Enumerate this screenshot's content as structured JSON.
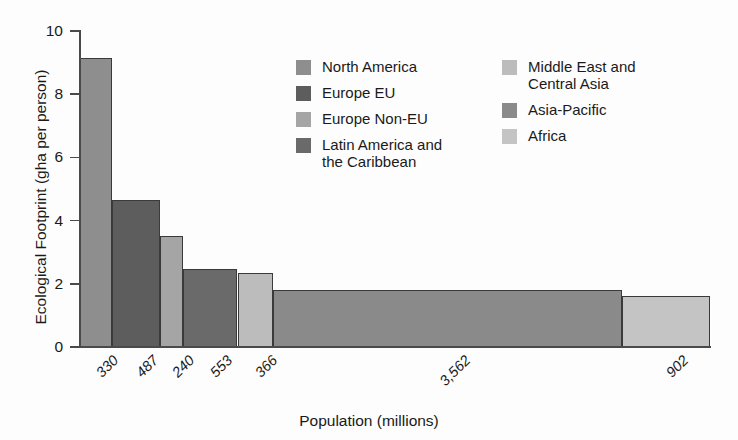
{
  "chart_data": {
    "type": "bar",
    "variant": "variable-width-bar",
    "title": "",
    "xlabel": "Population (millions)",
    "ylabel": "Ecological Footprint (gha per person)",
    "ylim": [
      0,
      10
    ],
    "yticks": [
      0,
      2,
      4,
      6,
      8,
      10
    ],
    "ytick_labels": [
      "0",
      "2",
      "4",
      "6",
      "8",
      "10"
    ],
    "grid": false,
    "legend_position": "inside-upper-center",
    "x_is_cumulative_population": true,
    "categories": [
      "North America",
      "Europe EU",
      "Europe Non-EU",
      "Latin America and the Caribbean",
      "Middle East and Central Asia",
      "Asia-Pacific",
      "Africa"
    ],
    "xtick_labels": [
      "330",
      "487",
      "240",
      "553",
      "366",
      "3,562",
      "902"
    ],
    "series": [
      {
        "name": "Ecological Footprint (gha per person)",
        "values": [
          9.15,
          4.65,
          3.5,
          2.48,
          2.35,
          1.8,
          1.6
        ]
      },
      {
        "name": "Population (millions)",
        "values": [
          330,
          487,
          240,
          553,
          366,
          3562,
          902
        ]
      }
    ],
    "bars": [
      {
        "label": "North America",
        "population": 330,
        "population_label": "330",
        "footprint": 9.15,
        "color": "#8e8e8e"
      },
      {
        "label": "Europe EU",
        "population": 487,
        "population_label": "487",
        "footprint": 4.65,
        "color": "#5d5d5d"
      },
      {
        "label": "Europe Non-EU",
        "population": 240,
        "population_label": "240",
        "footprint": 3.5,
        "color": "#a5a5a5"
      },
      {
        "label": "Latin America and the Caribbean",
        "population": 553,
        "population_label": "553",
        "footprint": 2.48,
        "color": "#6a6a6a"
      },
      {
        "label": "Middle East and Central Asia",
        "population": 366,
        "population_label": "366",
        "footprint": 2.35,
        "color": "#bcbcbc"
      },
      {
        "label": "Asia-Pacific",
        "population": 3562,
        "population_label": "3,562",
        "footprint": 1.8,
        "color": "#8a8a8a"
      },
      {
        "label": "Africa",
        "population": 902,
        "population_label": "902",
        "footprint": 1.6,
        "color": "#c4c4c4"
      }
    ]
  },
  "legend": {
    "columns": [
      {
        "items": [
          {
            "label": "North America",
            "color": "#8e8e8e"
          },
          {
            "label": "Europe EU",
            "color": "#5d5d5d"
          },
          {
            "label": "Europe Non-EU",
            "color": "#a5a5a5"
          },
          {
            "label": "Latin America and\nthe Caribbean",
            "color": "#6a6a6a"
          }
        ]
      },
      {
        "items": [
          {
            "label": "Middle East and\nCentral Asia",
            "color": "#bcbcbc"
          },
          {
            "label": "Asia-Pacific",
            "color": "#8a8a8a"
          },
          {
            "label": "Africa",
            "color": "#c4c4c4"
          }
        ]
      }
    ]
  },
  "axes": {
    "y_title": "Ecological Footprint (gha per person)",
    "x_title": "Population (millions)"
  }
}
